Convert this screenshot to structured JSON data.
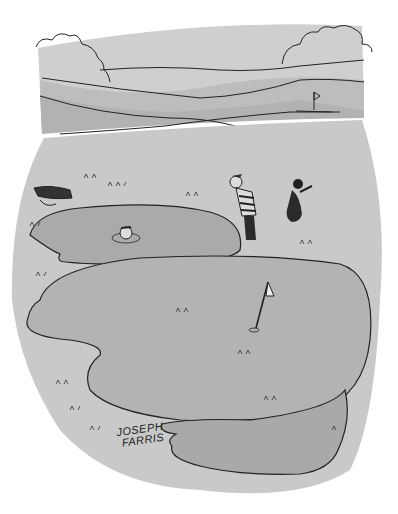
{
  "image": {
    "type": "cartoon-illustration",
    "style": "black ink line drawing with gray tones",
    "colors": {
      "background": "#ffffff",
      "sky_band": "#cfcfcf",
      "hills": "#b8b8b8",
      "fairway": "#c9c9c9",
      "green": "#b3b3b3",
      "sand": "#a9a9a9",
      "ink": "#222222"
    }
  },
  "scene": {
    "background_label": "distant rolling hills with trees and a flag",
    "foreground_label": "golf green with a hazard pond and bunker",
    "characters": [
      {
        "label": "golfer in striped shirt looking into pond"
      },
      {
        "label": "dog holding golf bag"
      },
      {
        "label": "head peeking from pond water"
      }
    ],
    "objects": [
      {
        "label": "golf bag lying on ground"
      },
      {
        "label": "flag pin on green"
      },
      {
        "label": "distant flag on hill"
      }
    ]
  },
  "signature": {
    "line1": "JOSEPH",
    "line2": "FARRIS"
  }
}
